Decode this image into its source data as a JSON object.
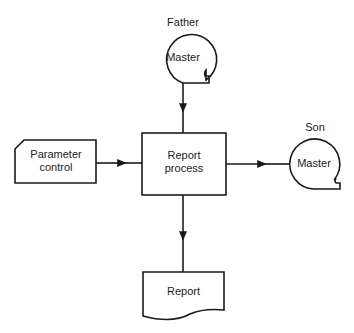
{
  "diagram": {
    "type": "flowchart",
    "nodes": {
      "father": {
        "caption": "Father",
        "label": "Master",
        "shape": "magnetic-tape"
      },
      "parameter": {
        "label_line1": "Parameter",
        "label_line2": "control",
        "shape": "punched-card"
      },
      "process": {
        "label_line1": "Report",
        "label_line2": "process",
        "shape": "process"
      },
      "son": {
        "caption": "Son",
        "label": "Master",
        "shape": "magnetic-tape"
      },
      "report": {
        "label": "Report",
        "shape": "document"
      }
    },
    "edges": [
      {
        "from": "father",
        "to": "process"
      },
      {
        "from": "parameter",
        "to": "process"
      },
      {
        "from": "process",
        "to": "son"
      },
      {
        "from": "process",
        "to": "report"
      }
    ]
  }
}
